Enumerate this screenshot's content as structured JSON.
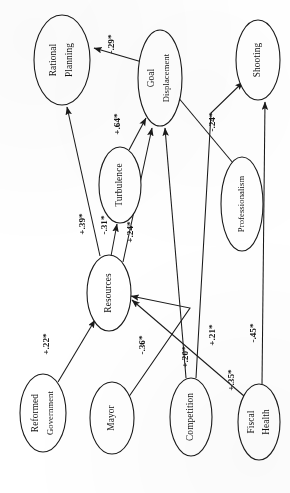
{
  "diagram": {
    "type": "path-diagram",
    "orientation": "rotated-90-ccw",
    "significance_note": "*",
    "nodes": [
      {
        "id": "rational_planning",
        "label_line1": "Rational",
        "label_line2": "Planning",
        "cx": 62,
        "cy": 60,
        "rx": 28,
        "ry": 45
      },
      {
        "id": "goal_displacement",
        "label_line1": "Goal",
        "label_line2": "Displacement",
        "cx": 160,
        "cy": 78,
        "rx": 22,
        "ry": 48
      },
      {
        "id": "shooting",
        "label_line1": "Shooting",
        "label_line2": "",
        "cx": 258,
        "cy": 60,
        "rx": 22,
        "ry": 40
      },
      {
        "id": "turbulence",
        "label_line1": "Turbulence",
        "label_line2": "",
        "cx": 120,
        "cy": 185,
        "rx": 21,
        "ry": 38
      },
      {
        "id": "professionalism",
        "label_line1": "Professionalism",
        "label_line2": "",
        "cx": 242,
        "cy": 204,
        "rx": 21,
        "ry": 47
      },
      {
        "id": "resources",
        "label_line1": "Resources",
        "label_line2": "",
        "cx": 109,
        "cy": 293,
        "rx": 22,
        "ry": 38
      },
      {
        "id": "reformed_government",
        "label_line1": "Reformed",
        "label_line2": "Government",
        "cx": 43,
        "cy": 413,
        "rx": 23,
        "ry": 39
      },
      {
        "id": "mayor",
        "label_line1": "Mayor",
        "label_line2": "",
        "cx": 112,
        "cy": 418,
        "rx": 22,
        "ry": 36
      },
      {
        "id": "competition",
        "label_line1": "Competition",
        "label_line2": "",
        "cx": 191,
        "cy": 417,
        "rx": 21,
        "ry": 39
      },
      {
        "id": "fiscal_health",
        "label_line1": "Fiscal",
        "label_line2": "Health",
        "cx": 259,
        "cy": 422,
        "rx": 21,
        "ry": 38
      }
    ],
    "edges": [
      {
        "id": "goal_to_rational",
        "from": "goal_displacement",
        "to": "rational_planning",
        "coef": "-.29*",
        "lx": 112,
        "ly": 44
      },
      {
        "id": "turbulence_to_goal",
        "from": "turbulence",
        "to": "goal_displacement",
        "coef": "+.64*",
        "lx": 118,
        "ly": 124
      },
      {
        "id": "resources_to_rational",
        "from": "resources",
        "to": "rational_planning",
        "coef": "+.39*",
        "lx": 83,
        "ly": 224
      },
      {
        "id": "resources_to_turbulence",
        "from": "resources",
        "to": "turbulence",
        "coef": "-.31*",
        "lx": 105,
        "ly": 225
      },
      {
        "id": "resources_to_goal",
        "from": "resources",
        "to": "goal_displacement",
        "coef": "+.24*",
        "lx": 131,
        "ly": 232
      },
      {
        "id": "professionalism_to_goal",
        "from": "professionalism",
        "to": "goal_displacement",
        "coef": "-.24*",
        "lx": 213,
        "ly": 122
      },
      {
        "id": "reformed_to_resources",
        "from": "reformed_government",
        "to": "resources",
        "coef": "+.22*",
        "lx": 47,
        "ly": 344
      },
      {
        "id": "mayor_to_resources",
        "from": "mayor",
        "to": "resources",
        "coef": "-.36*",
        "lx": 143,
        "ly": 345
      },
      {
        "id": "competition_to_goal",
        "from": "competition",
        "to": "goal_displacement",
        "coef": "+.20*",
        "lx": 186,
        "ly": 357
      },
      {
        "id": "competition_to_shooting",
        "from": "competition",
        "to": "shooting",
        "coef": "+.21*",
        "lx": 213,
        "ly": 335
      },
      {
        "id": "fiscal_to_resources",
        "from": "fiscal_health",
        "to": "resources",
        "coef": "+.35*",
        "lx": 232,
        "ly": 380
      },
      {
        "id": "fiscal_to_shooting",
        "from": "fiscal_health",
        "to": "shooting",
        "coef": "-.45*",
        "lx": 254,
        "ly": 333
      }
    ]
  },
  "colors": {
    "stroke": "#1a1a1a",
    "node_fill": "#ffffff",
    "text": "#111111",
    "background": "#ffffff"
  }
}
